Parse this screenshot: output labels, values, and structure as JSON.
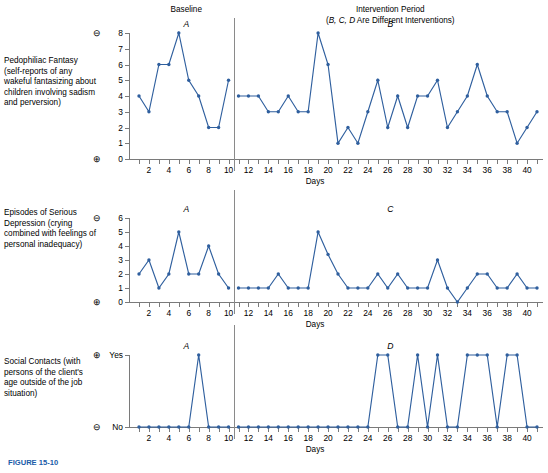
{
  "figure": {
    "caption_partial": "FIGURE 15-10",
    "baseline_title": "Baseline",
    "intervention_title": "Intervention Period",
    "intervention_subtitle": "(B, C, D Are Different Interventions)",
    "x_axis_caption": "Days",
    "accent_color": "#2f5f9e",
    "axis_color": "#7a7a7a",
    "minus_glyph": "⊖",
    "plus_glyph": "⊕"
  },
  "panels": [
    {
      "row_label": "Pedophiliac Fantasy (self-reports of any wakeful fantasizing about children involving sadism and perversion)",
      "baseline_letter": "A",
      "intervention_letter": "B",
      "top_sign": "minus",
      "bottom_sign": "plus",
      "y_labels": [
        "0",
        "1",
        "2",
        "3",
        "4",
        "5",
        "6",
        "7",
        "8"
      ],
      "chart_data": {
        "type": "line",
        "title": "Pedophiliac Fantasy",
        "xlabel": "Days",
        "ylabel": "Pedophiliac Fantasy (self-reports)",
        "ylim": [
          0,
          8
        ],
        "xlim": [
          1,
          41
        ],
        "grid": false,
        "xticks": [
          2,
          4,
          6,
          8,
          10,
          12,
          14,
          16,
          18,
          20,
          22,
          24,
          26,
          28,
          30,
          32,
          34,
          36,
          38,
          40
        ],
        "yticks": [
          0,
          1,
          2,
          3,
          4,
          5,
          6,
          7,
          8
        ],
        "phase_break_after_day": 10,
        "series": [
          {
            "name": "Baseline A",
            "x": [
              1,
              2,
              3,
              4,
              5,
              6,
              7,
              8,
              9,
              10
            ],
            "values": [
              4,
              3,
              6,
              6,
              8,
              5,
              4,
              2,
              2,
              5
            ]
          },
          {
            "name": "Intervention B",
            "x": [
              11,
              12,
              13,
              14,
              15,
              16,
              17,
              18,
              19,
              20,
              21,
              22,
              23,
              24,
              25,
              26,
              27,
              28,
              29,
              30,
              31,
              32,
              33,
              34,
              35,
              36,
              37,
              38,
              39,
              40,
              41
            ],
            "values": [
              4,
              4,
              4,
              3,
              3,
              4,
              3,
              3,
              8,
              6,
              1,
              2,
              1,
              3,
              5,
              2,
              4,
              2,
              4,
              4,
              5,
              2,
              3,
              4,
              6,
              4,
              3,
              3,
              1,
              2,
              3
            ]
          }
        ]
      }
    },
    {
      "row_label": "Episodes of Serious Depression (crying combined with feelings of personal inadequacy)",
      "baseline_letter": "A",
      "intervention_letter": "C",
      "top_sign": "minus",
      "bottom_sign": "plus",
      "y_labels": [
        "0",
        "1",
        "2",
        "3",
        "4",
        "5",
        "6"
      ],
      "chart_data": {
        "type": "line",
        "title": "Episodes of Serious Depression",
        "xlabel": "Days",
        "ylabel": "Episodes of Serious Depression",
        "ylim": [
          0,
          6
        ],
        "xlim": [
          1,
          41
        ],
        "grid": false,
        "xticks": [
          2,
          4,
          6,
          8,
          10,
          12,
          14,
          16,
          18,
          20,
          22,
          24,
          26,
          28,
          30,
          32,
          34,
          36,
          38,
          40
        ],
        "yticks": [
          0,
          1,
          2,
          3,
          4,
          5,
          6
        ],
        "phase_break_after_day": 10,
        "series": [
          {
            "name": "Baseline A",
            "x": [
              1,
              2,
              3,
              4,
              5,
              6,
              7,
              8,
              9,
              10
            ],
            "values": [
              2,
              3,
              1,
              2,
              5,
              2,
              2,
              4,
              2,
              1
            ]
          },
          {
            "name": "Intervention C",
            "x": [
              11,
              12,
              13,
              14,
              15,
              16,
              17,
              18,
              19,
              20,
              21,
              22,
              23,
              24,
              25,
              26,
              27,
              28,
              29,
              30,
              31,
              32,
              33,
              34,
              35,
              36,
              37,
              38,
              39,
              40,
              41
            ],
            "values": [
              1,
              1,
              1,
              1,
              2,
              1,
              1,
              1,
              5,
              3.4,
              2,
              1,
              1,
              1,
              2,
              1,
              2,
              1,
              1,
              1,
              3,
              1,
              0,
              1,
              2,
              2,
              1,
              1,
              2,
              1,
              1
            ]
          }
        ]
      }
    },
    {
      "row_label": "Social Contacts (with persons of the client's age outside of the job situation)",
      "baseline_letter": "A",
      "intervention_letter": "D",
      "top_sign": "plus",
      "bottom_sign": "minus",
      "y_labels": [
        "No",
        "Yes"
      ],
      "chart_data": {
        "type": "line",
        "title": "Social Contacts",
        "xlabel": "Days",
        "ylabel": "Social Contacts",
        "ylim": [
          0,
          1
        ],
        "ytick_labels": [
          "No",
          "Yes"
        ],
        "xlim": [
          1,
          41
        ],
        "grid": false,
        "xticks": [
          2,
          4,
          6,
          8,
          10,
          12,
          14,
          16,
          18,
          20,
          22,
          24,
          26,
          28,
          30,
          32,
          34,
          36,
          38,
          40
        ],
        "yticks": [
          0,
          1
        ],
        "phase_break_after_day": 10,
        "series": [
          {
            "name": "Baseline A",
            "x": [
              1,
              2,
              3,
              4,
              5,
              6,
              7,
              8,
              9,
              10
            ],
            "values": [
              0,
              0,
              0,
              0,
              0,
              0,
              1,
              0,
              0,
              0
            ]
          },
          {
            "name": "Intervention D",
            "x": [
              11,
              12,
              13,
              14,
              15,
              16,
              17,
              18,
              19,
              20,
              21,
              22,
              23,
              24,
              25,
              26,
              27,
              28,
              29,
              30,
              31,
              32,
              33,
              34,
              35,
              36,
              37,
              38,
              39,
              40,
              41
            ],
            "values": [
              0,
              0,
              0,
              0,
              0,
              0,
              0,
              0,
              0,
              0,
              0,
              0,
              0,
              0,
              1,
              1,
              0,
              0,
              1,
              0,
              1,
              0,
              0,
              1,
              1,
              1,
              0,
              1,
              1,
              0,
              0
            ]
          }
        ]
      }
    }
  ]
}
